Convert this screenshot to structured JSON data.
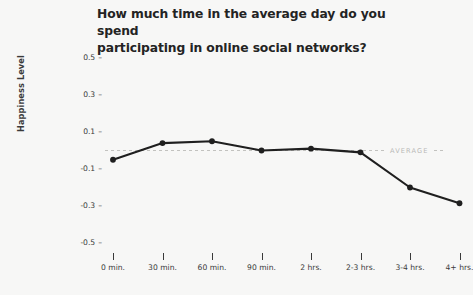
{
  "chart_data": {
    "type": "line",
    "title": "How much time in the average day do you spend participating in online social networks?",
    "title_line1": "How much time in the average day do you spend",
    "title_line2": "participating in online social networks?",
    "xlabel": "",
    "ylabel": "Happiness Level",
    "categories": [
      "0 min.",
      "30 min.",
      "60 min.",
      "90 min.",
      "2 hrs.",
      "2-3 hrs.",
      "3-4 hrs.",
      "4+ hrs."
    ],
    "values": [
      -0.05,
      0.04,
      0.05,
      0.0,
      0.01,
      -0.01,
      -0.2,
      -0.285
    ],
    "ylim": [
      -0.5,
      0.5
    ],
    "yticks": [
      "0.5",
      "0.3",
      "0.1",
      "-0.1",
      "-0.3",
      "-0.5"
    ],
    "ytick_values": [
      0.5,
      0.3,
      0.1,
      -0.1,
      -0.3,
      -0.5
    ],
    "grid": false,
    "legend": "none",
    "reference_line": {
      "label": "AVERAGE",
      "value": 0.0,
      "style": "dashed",
      "color": "#c2c2bf"
    },
    "series_color": "#1f1f1f",
    "marker": "circle",
    "background_color": "#f7f7f6",
    "text_color": "#3a3a3a"
  }
}
